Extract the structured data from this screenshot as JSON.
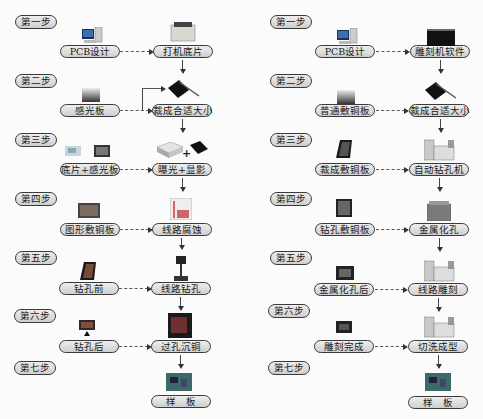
{
  "left_flow": {
    "steps": [
      "第一步",
      "第二步",
      "第三步",
      "第四步",
      "第五步",
      "第六步",
      "第七步"
    ],
    "inputs": [
      "PCB设计",
      "感光板",
      "底片+感光板",
      "图形敷铜板",
      "钻孔前",
      "钻孔后"
    ],
    "processes": [
      "打机底片",
      "裁成合适大小",
      "曝光+显影",
      "线路腐蚀",
      "线路钻孔",
      "过孔沉铜"
    ],
    "result": "样　板"
  },
  "right_flow": {
    "steps": [
      "第一步",
      "第二步",
      "第三步",
      "第四步",
      "第五步",
      "第六步",
      "第七步"
    ],
    "inputs": [
      "PCB设计",
      "普通敷铜板",
      "裁成敷铜板",
      "钻孔敷铜板",
      "金属化孔后",
      "雕刻完成"
    ],
    "processes": [
      "雕刻机软件",
      "裁成合适大小",
      "自动钻孔机",
      "金属化孔",
      "线路雕刻",
      "切洗成型"
    ],
    "result": "样　板"
  },
  "symbols": {
    "plus": "+"
  },
  "icons": {
    "left": [
      "computer-icon",
      "printer-icon",
      "photosensitive-board-icon",
      "cutter-icon",
      "film-board-icon",
      "exposure-box-icon",
      "developer-tray-icon",
      "patterned-board-icon",
      "etching-tank-icon",
      "board-before-drill-icon",
      "drill-press-icon",
      "board-after-drill-icon",
      "plating-machine-icon",
      "sample-board-icon"
    ],
    "right": [
      "computer-icon",
      "monitor-icon",
      "copper-board-icon",
      "cutter-icon",
      "cut-board-icon",
      "cnc-drill-icon",
      "drilled-board-icon",
      "plating-tank-icon",
      "plated-board-icon",
      "engraving-machine-icon",
      "engraved-board-icon",
      "engraving-machine-icon",
      "sample-board-icon"
    ]
  }
}
